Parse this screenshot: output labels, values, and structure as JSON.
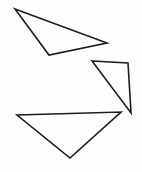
{
  "figure": {
    "canvas": {
      "width": 142,
      "height": 172,
      "background_color": "#fdfdfd"
    },
    "style": {
      "stroke_color": "#1b1b1b",
      "stroke_width": 1.6,
      "fill": "none"
    },
    "shape_count": 3
  },
  "chart_data": {
    "type": "diagram",
    "xlabel": "",
    "ylabel": "",
    "xlim": [
      0,
      142
    ],
    "ylim": [
      0,
      172
    ],
    "grid": false,
    "legend": "none",
    "shapes": [
      {
        "name": "triangle-top-left",
        "kind": "triangle",
        "orientation": "thin wedge pointing left, long edge sloping down to the right",
        "points": "15,9 107,43 49,55",
        "vertices": [
          {
            "label": "left-apex",
            "x": 15,
            "y": 9
          },
          {
            "label": "right-point",
            "x": 107,
            "y": 43
          },
          {
            "label": "bottom-vertex",
            "x": 49,
            "y": 55
          }
        ]
      },
      {
        "name": "triangle-middle-right",
        "kind": "triangle",
        "orientation": "narrow wedge pointing left, near-vertical right edge",
        "points": "92,61 128,63 131,113",
        "vertices": [
          {
            "label": "left-apex",
            "x": 92,
            "y": 61
          },
          {
            "label": "top-right",
            "x": 128,
            "y": 63
          },
          {
            "label": "bottom-right",
            "x": 131,
            "y": 113
          }
        ]
      },
      {
        "name": "triangle-bottom",
        "kind": "triangle",
        "orientation": "downward-pointing, flat top edge",
        "points": "17,115 121,112 70,158",
        "vertices": [
          {
            "label": "top-left",
            "x": 17,
            "y": 115
          },
          {
            "label": "top-right",
            "x": 121,
            "y": 112
          },
          {
            "label": "bottom-apex",
            "x": 70,
            "y": 158
          }
        ]
      }
    ]
  }
}
